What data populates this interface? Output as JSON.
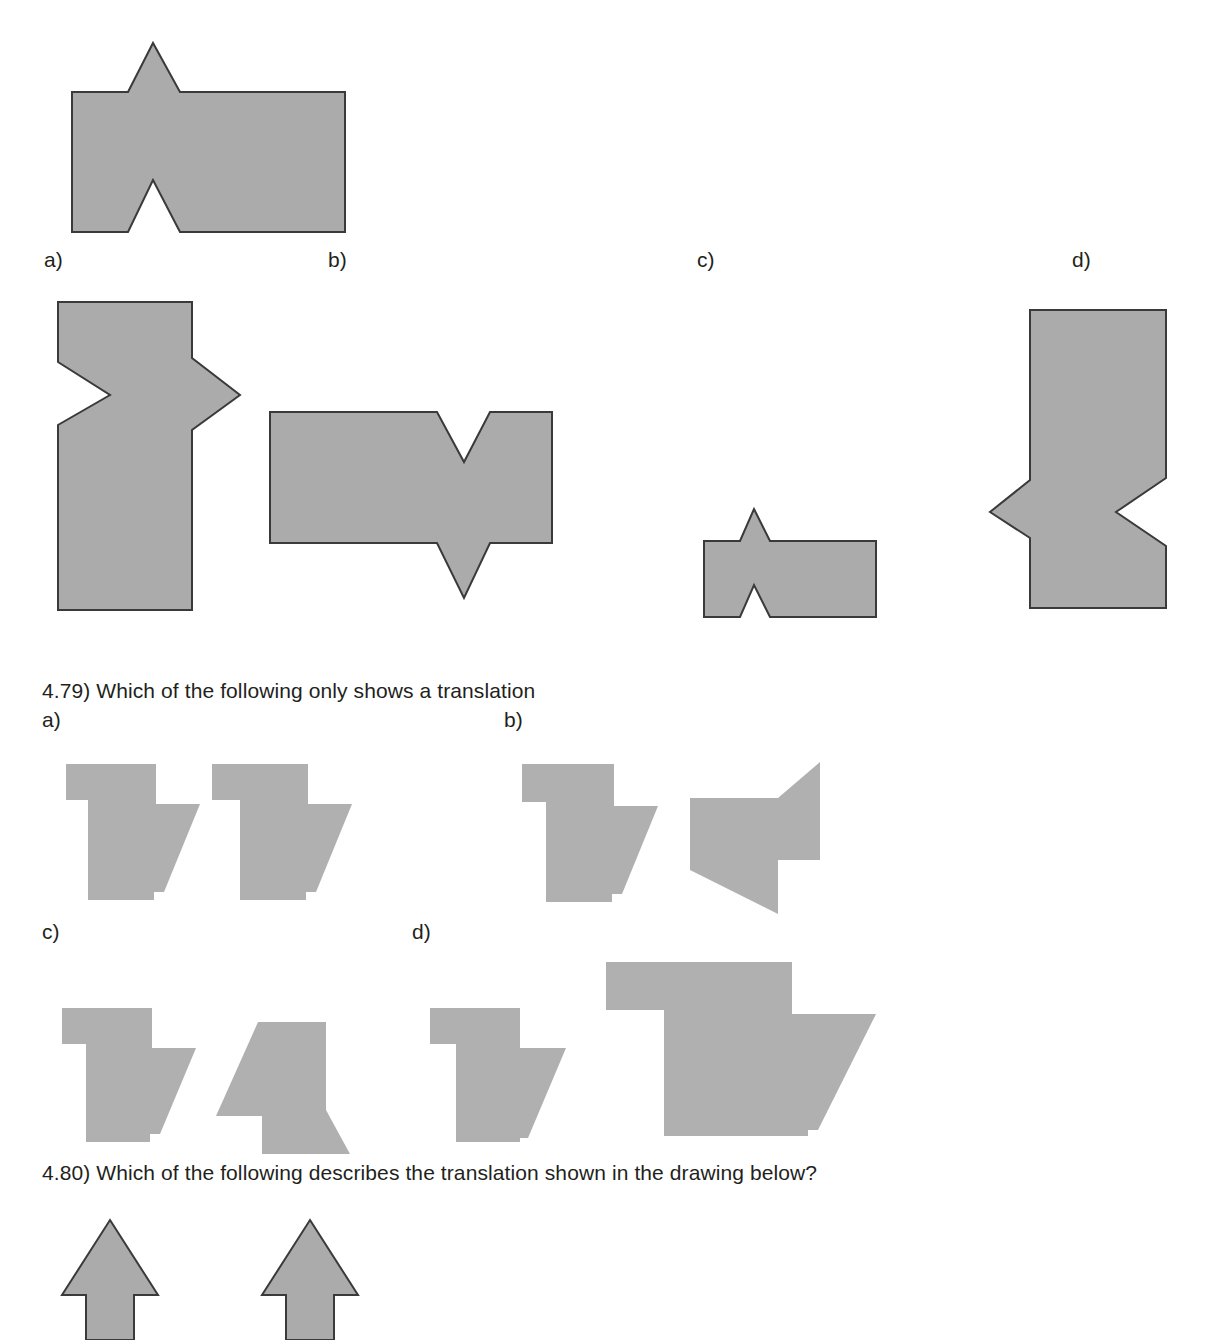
{
  "page": {
    "width": 1216,
    "height": 1327,
    "background_color": "#ffffff",
    "shape_fill_color": "#ababab",
    "shape_stroke_color": "#3a3a3a",
    "text_color": "#231f20"
  },
  "question_478": {
    "reference_figure_caption": "original figure",
    "options": [
      {
        "key": "a",
        "label": "a)",
        "transformation": "rotation"
      },
      {
        "key": "b",
        "label": "b)",
        "transformation": "reflection"
      },
      {
        "key": "c",
        "label": "c)",
        "transformation": "dilation-reduction"
      },
      {
        "key": "d",
        "label": "d)",
        "transformation": "rotation"
      }
    ]
  },
  "question_479": {
    "number": "4.79)",
    "prompt": "4.79) Which of the following only shows a translation",
    "options": [
      {
        "key": "a",
        "label": "a)",
        "transformation": "translation"
      },
      {
        "key": "b",
        "label": "b)",
        "transformation": "rotation"
      },
      {
        "key": "c",
        "label": "c)",
        "transformation": "rotation"
      },
      {
        "key": "d",
        "label": "d)",
        "transformation": "dilation"
      }
    ]
  },
  "question_480": {
    "number": "4.80)",
    "prompt": "4.80) Which of the following describes the translation shown in the drawing below?",
    "figure": {
      "name": "two-arrows",
      "arrow_count": 2,
      "direction": "up"
    }
  }
}
